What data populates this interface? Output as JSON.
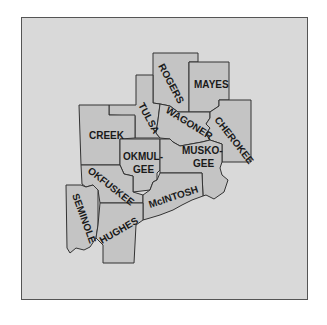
{
  "map": {
    "region": "Northeast Oklahoma counties",
    "colors": {
      "background": "#d9d9d9",
      "county_fill": "#c4c4c4",
      "border": "#333333"
    },
    "counties": [
      {
        "name": "ROGERS"
      },
      {
        "name": "MAYES"
      },
      {
        "name": "TULSA"
      },
      {
        "name": "WAGONER"
      },
      {
        "name": "CHEROKEE"
      },
      {
        "name": "CREEK"
      },
      {
        "name": "OKMUL-",
        "name2": "GEE"
      },
      {
        "name": "MUSKO-",
        "name2": "GEE"
      },
      {
        "name": "OKFUSKEE"
      },
      {
        "name": "McINTOSH"
      },
      {
        "name": "SEMINOLE"
      },
      {
        "name": "HUGHES"
      }
    ]
  }
}
